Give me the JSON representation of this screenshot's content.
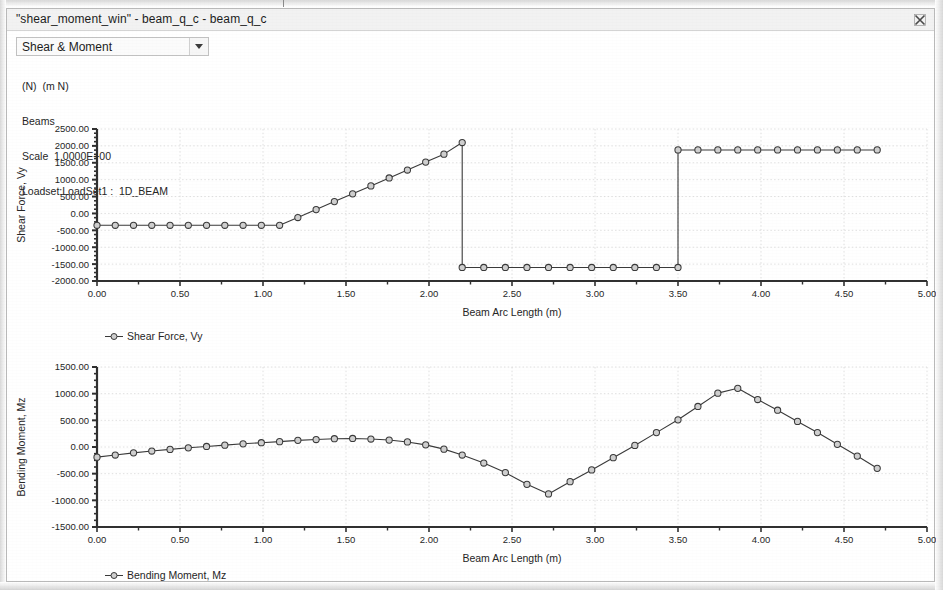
{
  "window": {
    "title": "\"shear_moment_win\" - beam_q_c - beam_q_c",
    "close_icon": "close-icon"
  },
  "toolbar": {
    "mode_select_value": "Shear & Moment",
    "mode_select_arrow_icon": "chevron-down-icon"
  },
  "info": {
    "line1": "(N)  (m N)",
    "line2": "Beams",
    "line3": "Scale  1.0000E+00",
    "line4": "Loadset:LoadSet1 :  1D_BEAM"
  },
  "colors": {
    "line": "#3a3a3a",
    "axis": "#303030",
    "grid": "#d8d8d8",
    "text": "#262626",
    "marker_fill": "#cfcfcf",
    "background": "#ffffff",
    "titlebar": "#f2f2f2"
  },
  "legends": {
    "shear": "Shear Force, Vy",
    "moment": "Bending Moment, Mz"
  },
  "chart_data": [
    {
      "id": "shear",
      "type": "line",
      "title": "",
      "xlabel": "Beam Arc Length (m)",
      "ylabel": "Shear Force, Vy",
      "xlim": [
        0.0,
        5.0
      ],
      "ylim": [
        -2000.0,
        2500.0
      ],
      "xticks": [
        0.0,
        0.5,
        1.0,
        1.5,
        2.0,
        2.5,
        3.0,
        3.5,
        4.0,
        4.5,
        5.0
      ],
      "xticklabels": [
        "0.00",
        "0.50",
        "1.00",
        "1.50",
        "2.00",
        "2.50",
        "3.00",
        "3.50",
        "4.00",
        "4.50",
        "5.00"
      ],
      "yticks": [
        -2000.0,
        -1500.0,
        -1000.0,
        -500.0,
        0.0,
        500.0,
        1000.0,
        1500.0,
        2000.0,
        2500.0
      ],
      "yticklabels": [
        "-2000.00",
        "-1500.00",
        "-1000.00",
        "-500.00",
        "0.00",
        "500.00",
        "1000.00",
        "1500.00",
        "2000.00",
        "2500.00"
      ],
      "grid": true,
      "legend": "Shear Force, Vy",
      "legend_position": "below-left",
      "markers": "circle",
      "series": [
        {
          "name": "Shear Force, Vy",
          "x": [
            0.0,
            0.11,
            0.22,
            0.33,
            0.44,
            0.55,
            0.66,
            0.77,
            0.88,
            0.99,
            1.1,
            1.21,
            1.32,
            1.43,
            1.54,
            1.65,
            1.76,
            1.87,
            1.98,
            2.09,
            2.2,
            2.2,
            2.33,
            2.46,
            2.59,
            2.72,
            2.85,
            2.98,
            3.11,
            3.24,
            3.37,
            3.5,
            3.5,
            3.62,
            3.74,
            3.86,
            3.98,
            4.1,
            4.22,
            4.34,
            4.46,
            4.58,
            4.7
          ],
          "y": [
            -350,
            -350,
            -350,
            -350,
            -350,
            -350,
            -350,
            -350,
            -350,
            -350,
            -350,
            -120,
            115,
            350,
            580,
            815,
            1050,
            1285,
            1520,
            1755,
            2100,
            -1600,
            -1600,
            -1600,
            -1600,
            -1600,
            -1600,
            -1600,
            -1600,
            -1600,
            -1600,
            -1600,
            1880,
            1880,
            1880,
            1880,
            1880,
            1880,
            1880,
            1880,
            1880,
            1880,
            1880
          ]
        }
      ]
    },
    {
      "id": "moment",
      "type": "line",
      "title": "",
      "xlabel": "Beam Arc Length (m)",
      "ylabel": "Bending Moment, Mz",
      "xlim": [
        0.0,
        5.0
      ],
      "ylim": [
        -1500.0,
        1500.0
      ],
      "xticks": [
        0.0,
        0.5,
        1.0,
        1.5,
        2.0,
        2.5,
        3.0,
        3.5,
        4.0,
        4.5,
        5.0
      ],
      "xticklabels": [
        "0.00",
        "0.50",
        "1.00",
        "1.50",
        "2.00",
        "2.50",
        "3.00",
        "3.50",
        "4.00",
        "4.50",
        "5.00"
      ],
      "yticks": [
        -1500.0,
        -1000.0,
        -500.0,
        0.0,
        500.0,
        1000.0,
        1500.0
      ],
      "yticklabels": [
        "-1500.00",
        "-1000.00",
        "-500.00",
        "0.00",
        "500.00",
        "1000.00",
        "1500.00"
      ],
      "grid": true,
      "legend": "Bending Moment, Mz",
      "legend_position": "below-left",
      "markers": "circle",
      "series": [
        {
          "name": "Bending Moment, Mz",
          "x": [
            0.0,
            0.11,
            0.22,
            0.33,
            0.44,
            0.55,
            0.66,
            0.77,
            0.88,
            0.99,
            1.1,
            1.21,
            1.32,
            1.43,
            1.54,
            1.65,
            1.76,
            1.87,
            1.98,
            2.09,
            2.2,
            2.33,
            2.46,
            2.59,
            2.72,
            2.85,
            2.98,
            3.11,
            3.24,
            3.37,
            3.5,
            3.62,
            3.74,
            3.86,
            3.98,
            4.1,
            4.22,
            4.34,
            4.46,
            4.58,
            4.7
          ],
          "y": [
            -190,
            -150,
            -110,
            -75,
            -45,
            -15,
            10,
            35,
            60,
            80,
            100,
            125,
            140,
            155,
            160,
            150,
            130,
            95,
            40,
            -40,
            -150,
            -300,
            -480,
            -700,
            -880,
            -650,
            -430,
            -200,
            30,
            270,
            510,
            760,
            1010,
            1100,
            890,
            690,
            480,
            270,
            50,
            -170,
            -400
          ]
        }
      ]
    }
  ]
}
